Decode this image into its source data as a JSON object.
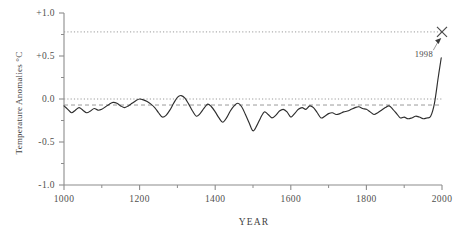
{
  "chart_data": {
    "type": "line",
    "title": "",
    "subtitle": "",
    "xlabel": "YEAR",
    "ylabel": "Temperature Anomalies °C",
    "xlim": [
      1000,
      2000
    ],
    "ylim": [
      -1.0,
      1.0
    ],
    "grid": false,
    "legend_position": "none",
    "x_ticks": [
      1000,
      1200,
      1400,
      1600,
      1800,
      2000
    ],
    "x_tick_labels": [
      "1000",
      "1200",
      "1400",
      "1600",
      "1800",
      "2000"
    ],
    "x_minor_ticks": [
      1100,
      1300,
      1500,
      1700,
      1900
    ],
    "y_ticks": [
      -1.0,
      -0.5,
      0.0,
      0.5,
      1.0
    ],
    "y_tick_labels": [
      "-1.0",
      "-0.5",
      "0.0",
      "+0.5",
      "+1.0"
    ],
    "y_minor_ticks": [
      -0.75,
      -0.25,
      0.25,
      0.75
    ],
    "reference_lines": [
      {
        "name": "1998-level-dotted",
        "y": 0.78,
        "style": "dotted"
      },
      {
        "name": "zero-baseline-dotted",
        "y": 0.0,
        "style": "dotted"
      },
      {
        "name": "long-term-mean-dashed",
        "y": -0.07,
        "style": "dashed"
      }
    ],
    "annotations": [
      {
        "name": "1998-callout",
        "text": "1998",
        "x": 1952,
        "y": 0.52,
        "points_to_x": 1998,
        "points_to_y": 0.78
      }
    ],
    "markers": [
      {
        "name": "1998-x-marker",
        "symbol": "x",
        "x": 2000,
        "y": 0.78
      }
    ],
    "series": [
      {
        "name": "Northern Hemisphere temperature anomaly reconstruction",
        "x": [
          1000,
          1010,
          1020,
          1030,
          1040,
          1050,
          1060,
          1070,
          1080,
          1090,
          1100,
          1110,
          1120,
          1130,
          1140,
          1150,
          1160,
          1170,
          1180,
          1190,
          1200,
          1210,
          1220,
          1230,
          1240,
          1250,
          1260,
          1270,
          1280,
          1290,
          1300,
          1310,
          1320,
          1330,
          1340,
          1350,
          1360,
          1370,
          1380,
          1390,
          1400,
          1410,
          1420,
          1430,
          1440,
          1450,
          1460,
          1470,
          1480,
          1490,
          1500,
          1510,
          1520,
          1530,
          1540,
          1550,
          1560,
          1570,
          1580,
          1590,
          1600,
          1610,
          1620,
          1630,
          1640,
          1650,
          1660,
          1670,
          1680,
          1690,
          1700,
          1710,
          1720,
          1730,
          1740,
          1750,
          1760,
          1770,
          1780,
          1790,
          1800,
          1810,
          1820,
          1830,
          1840,
          1850,
          1860,
          1870,
          1880,
          1890,
          1900,
          1910,
          1920,
          1930,
          1940,
          1950,
          1960,
          1970,
          1980,
          1990,
          1998
        ],
        "values": [
          -0.08,
          -0.12,
          -0.16,
          -0.13,
          -0.1,
          -0.13,
          -0.16,
          -0.14,
          -0.11,
          -0.13,
          -0.12,
          -0.09,
          -0.06,
          -0.04,
          -0.05,
          -0.08,
          -0.1,
          -0.08,
          -0.05,
          -0.02,
          0.0,
          -0.01,
          -0.03,
          -0.06,
          -0.1,
          -0.16,
          -0.21,
          -0.19,
          -0.13,
          -0.05,
          0.02,
          0.04,
          0.01,
          -0.06,
          -0.14,
          -0.2,
          -0.17,
          -0.11,
          -0.06,
          -0.09,
          -0.15,
          -0.22,
          -0.27,
          -0.22,
          -0.14,
          -0.08,
          -0.05,
          -0.09,
          -0.18,
          -0.28,
          -0.37,
          -0.31,
          -0.22,
          -0.15,
          -0.18,
          -0.22,
          -0.19,
          -0.14,
          -0.12,
          -0.15,
          -0.21,
          -0.17,
          -0.12,
          -0.1,
          -0.12,
          -0.08,
          -0.1,
          -0.16,
          -0.22,
          -0.2,
          -0.17,
          -0.16,
          -0.18,
          -0.17,
          -0.15,
          -0.14,
          -0.12,
          -0.1,
          -0.09,
          -0.11,
          -0.12,
          -0.15,
          -0.18,
          -0.16,
          -0.13,
          -0.1,
          -0.08,
          -0.12,
          -0.17,
          -0.22,
          -0.21,
          -0.23,
          -0.22,
          -0.2,
          -0.21,
          -0.23,
          -0.22,
          -0.2,
          -0.05,
          0.25,
          0.48
        ]
      }
    ]
  },
  "figure": {
    "y_axis_title": "Temperature Anomalies °C",
    "x_axis_title": "YEAR",
    "callout_label": "1998"
  },
  "colors": {
    "series": "#2e2e2e",
    "axis": "#8c8c8c",
    "reference": "#9a9a9a",
    "text": "#3f3f3f",
    "background": "#ffffff"
  }
}
